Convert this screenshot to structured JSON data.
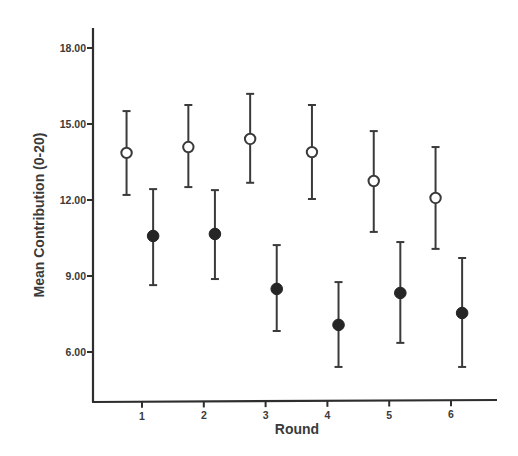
{
  "chart_data": {
    "type": "scatter",
    "subtype": "error-bar",
    "title": "",
    "xlabel": "Round",
    "ylabel": "Mean Contribution (0-20)",
    "categories": [
      "1",
      "2",
      "3",
      "4",
      "5",
      "6"
    ],
    "x": [
      1,
      2,
      3,
      4,
      5,
      6
    ],
    "yticks": [
      "6.00",
      "9.00",
      "12.00",
      "15.00",
      "18.00"
    ],
    "ylim": [
      3.9,
      18.8
    ],
    "grid": false,
    "legend": null,
    "series": [
      {
        "name": "open-circles",
        "marker": "open-circle",
        "x_offset": -0.25,
        "values": [
          13.86,
          14.09,
          14.41,
          13.89,
          12.75,
          12.08
        ],
        "upper": [
          15.51,
          15.75,
          16.19,
          15.75,
          14.72,
          14.09
        ],
        "lower": [
          12.2,
          12.51,
          12.68,
          12.04,
          10.74,
          10.07
        ]
      },
      {
        "name": "filled-circles",
        "marker": "filled-circle",
        "x_offset": 0.18,
        "values": [
          10.58,
          10.66,
          8.49,
          7.07,
          8.33,
          7.54
        ],
        "upper": [
          12.43,
          12.39,
          10.22,
          8.76,
          10.34,
          9.71
        ],
        "lower": [
          8.64,
          8.88,
          6.83,
          5.41,
          6.36,
          5.41
        ]
      }
    ]
  },
  "axes": {
    "x_title": "Round",
    "y_title": "Mean Contribution (0-20)",
    "x_tick_labels": [
      "1",
      "2",
      "3",
      "4",
      "5",
      "6"
    ],
    "y_tick_labels": [
      "18.00",
      "15.00",
      "12.00",
      "9.00",
      "6.00"
    ]
  },
  "colors": {
    "ink": "#2e2e2e",
    "background": "#ffffff"
  }
}
